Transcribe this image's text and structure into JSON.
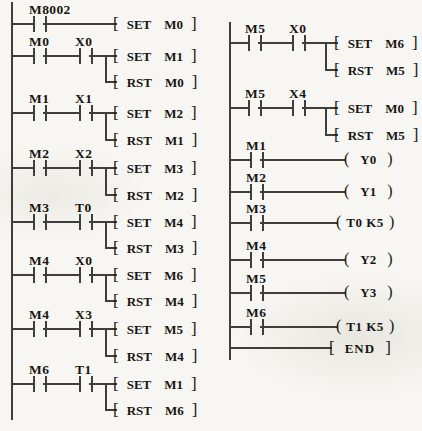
{
  "symbols": {
    "open_bracket": "[",
    "close_bracket": "]",
    "open_paren": "(",
    "close_paren": ")"
  },
  "colors": {
    "wire": "#3f3e3c",
    "text": "#181614",
    "background": "#f7f6f2"
  },
  "left_column": {
    "rungs": [
      {
        "contacts": [
          "M8002"
        ],
        "instructions": [
          {
            "op": "SET",
            "operand": "M0"
          }
        ]
      },
      {
        "contacts": [
          "M0",
          "X0"
        ],
        "instructions": [
          {
            "op": "SET",
            "operand": "M1"
          },
          {
            "op": "RST",
            "operand": "M0"
          }
        ]
      },
      {
        "contacts": [
          "M1",
          "X1"
        ],
        "instructions": [
          {
            "op": "SET",
            "operand": "M2"
          },
          {
            "op": "RST",
            "operand": "M1"
          }
        ]
      },
      {
        "contacts": [
          "M2",
          "X2"
        ],
        "instructions": [
          {
            "op": "SET",
            "operand": "M3"
          },
          {
            "op": "RST",
            "operand": "M2"
          }
        ]
      },
      {
        "contacts": [
          "M3",
          "T0"
        ],
        "instructions": [
          {
            "op": "SET",
            "operand": "M4"
          },
          {
            "op": "RST",
            "operand": "M3"
          }
        ]
      },
      {
        "contacts": [
          "M4",
          "X0"
        ],
        "instructions": [
          {
            "op": "SET",
            "operand": "M6"
          },
          {
            "op": "RST",
            "operand": "M4"
          }
        ]
      },
      {
        "contacts": [
          "M4",
          "X3"
        ],
        "instructions": [
          {
            "op": "SET",
            "operand": "M5"
          },
          {
            "op": "RST",
            "operand": "M4"
          }
        ]
      },
      {
        "contacts": [
          "M6",
          "T1"
        ],
        "instructions": [
          {
            "op": "SET",
            "operand": "M1"
          },
          {
            "op": "RST",
            "operand": "M6"
          }
        ]
      }
    ]
  },
  "right_column": {
    "rungs": [
      {
        "contacts": [
          "M5",
          "X0"
        ],
        "instructions": [
          {
            "op": "SET",
            "operand": "M6"
          },
          {
            "op": "RST",
            "operand": "M5"
          }
        ]
      },
      {
        "contacts": [
          "M5",
          "X4"
        ],
        "instructions": [
          {
            "op": "SET",
            "operand": "M0"
          },
          {
            "op": "RST",
            "operand": "M5"
          }
        ]
      },
      {
        "contacts": [
          "M1"
        ],
        "coil": "Y0"
      },
      {
        "contacts": [
          "M2"
        ],
        "coil": "Y1"
      },
      {
        "contacts": [
          "M3"
        ],
        "coil": "T0 K5"
      },
      {
        "contacts": [
          "M4"
        ],
        "coil": "Y2"
      },
      {
        "contacts": [
          "M5"
        ],
        "coil": "Y3"
      },
      {
        "contacts": [
          "M6"
        ],
        "coil": "T1 K5"
      },
      {
        "end_label": "END"
      }
    ]
  }
}
